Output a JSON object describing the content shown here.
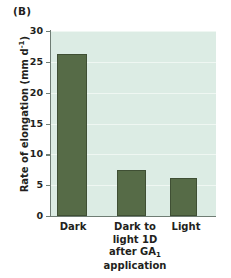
{
  "panel": {
    "label": "(B)"
  },
  "chart_data": {
    "type": "bar",
    "title": "",
    "xlabel": "",
    "ylabel": "Rate of elongation (mm d-1)",
    "ylabel_base": "Rate of elongation (mm d",
    "ylabel_exponent": "-1",
    "ylabel_tail": ")",
    "categories": [
      "Dark",
      "Dark to\nlight 1D\nafter GA1\napplication",
      "Light"
    ],
    "category_labels": [
      {
        "line1": "Dark"
      },
      {
        "line1": "Dark to",
        "line2": "light 1D",
        "line3_pre": "after GA",
        "line3_sub": "1",
        "line4": "application"
      },
      {
        "line1": "Light"
      }
    ],
    "values": [
      26.2,
      7.4,
      6.1
    ],
    "ylim": [
      0,
      30
    ],
    "yticks": [
      0,
      5,
      10,
      15,
      20,
      25,
      30
    ],
    "ytick_labels": [
      "0",
      "5",
      "10",
      "15",
      "20",
      "25",
      "30"
    ],
    "grid": true,
    "legend": null,
    "colors": {
      "bar_fill": "#566b47",
      "bar_border": "#3f4f34",
      "plot_background": "#dcece4",
      "gridline": "#f2f9f5",
      "axis": "#6f7d74",
      "text": "#231f20",
      "page_background": "#ffffff"
    }
  }
}
